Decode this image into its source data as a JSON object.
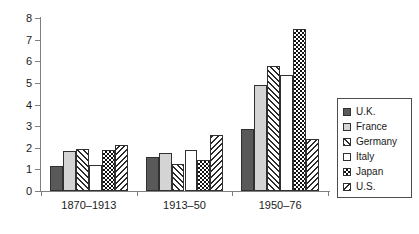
{
  "chart_data": {
    "type": "bar",
    "title": "",
    "subtitle": "",
    "xlabel": "",
    "ylabel": "",
    "categories": [
      "1870–1913",
      "1913–50",
      "1950–76"
    ],
    "series": [
      {
        "name": "U.K.",
        "values": [
          1.15,
          1.55,
          2.85
        ],
        "pattern": "solid-dark-gray"
      },
      {
        "name": "France",
        "values": [
          1.85,
          1.75,
          4.9
        ],
        "pattern": "solid-light-gray"
      },
      {
        "name": "Germany",
        "values": [
          1.95,
          1.25,
          5.8
        ],
        "pattern": "diagonal-hatch-forward"
      },
      {
        "name": "Italy",
        "values": [
          1.2,
          1.9,
          5.35
        ],
        "pattern": "white-empty"
      },
      {
        "name": "Japan",
        "values": [
          1.9,
          1.45,
          7.5
        ],
        "pattern": "checkerboard"
      },
      {
        "name": "U.S.",
        "values": [
          2.15,
          2.6,
          2.4
        ],
        "pattern": "diagonal-hatch-backward"
      }
    ],
    "ylim": [
      0,
      8
    ],
    "ytick_labels": [
      "0",
      "1",
      "2",
      "3",
      "4",
      "5",
      "6",
      "7",
      "8"
    ],
    "yticks": [
      0,
      1,
      2,
      3,
      4,
      5,
      6,
      7,
      8
    ],
    "grid": false,
    "legend_position": "right",
    "annotations": []
  },
  "legend": {
    "entries": [
      {
        "label": "U.K."
      },
      {
        "label": "France"
      },
      {
        "label": "Germany"
      },
      {
        "label": "Italy"
      },
      {
        "label": "Japan"
      },
      {
        "label": "U.S."
      }
    ]
  },
  "colors": {
    "uk": "#595959",
    "france": "#d4d4d4",
    "hatch": "#2b2b2b",
    "background": "#ffffff",
    "axis": "#808080",
    "text": "#1a1a1a"
  }
}
